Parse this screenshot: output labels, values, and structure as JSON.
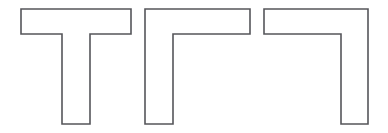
{
  "figure": {
    "background_color": "#ffffff",
    "stroke_color": "#55565a",
    "fill_color": "#ffffff",
    "stroke_width": 1.6,
    "canvas": {
      "width": 388,
      "height": 133
    },
    "shape_count": 3,
    "shapes": [
      {
        "name": "t-shape",
        "label": "T",
        "description": "T-shaped polygon: horizontal bar on top with a centered vertical stem descending",
        "orientation": "upright",
        "vertex_count": 8,
        "points": "21,9 131,9 131,34 90,34 90,124 62,124 62,34 21,34",
        "bbox": {
          "x": 21,
          "y": 9,
          "width": 110,
          "height": 115
        },
        "bar": {
          "x": 21,
          "y": 9,
          "width": 110,
          "height": 25
        },
        "stem": {
          "x": 62,
          "y": 34,
          "width": 28,
          "height": 90
        }
      },
      {
        "name": "gamma-shape",
        "label": "Γ",
        "description": "Gamma shaped polygon: horizontal bar on top with vertical leg descending from the left end",
        "orientation": "leg-left",
        "vertex_count": 6,
        "points": "145,9 250,9 250,34 173,34 173,124 145,124",
        "bbox": {
          "x": 145,
          "y": 9,
          "width": 105,
          "height": 115
        },
        "bar": {
          "x": 145,
          "y": 9,
          "width": 105,
          "height": 25
        },
        "leg": {
          "x": 145,
          "y": 34,
          "width": 28,
          "height": 90
        }
      },
      {
        "name": "mirrored-gamma-shape",
        "label": "7",
        "description": "Mirrored gamma / seven shaped polygon: horizontal bar on top with vertical leg descending from the right end",
        "orientation": "leg-right",
        "vertex_count": 6,
        "points": "264,9 368,9 368,124 341,124 341,34 264,34",
        "bbox": {
          "x": 264,
          "y": 9,
          "width": 104,
          "height": 115
        },
        "bar": {
          "x": 264,
          "y": 9,
          "width": 104,
          "height": 25
        },
        "leg": {
          "x": 341,
          "y": 34,
          "width": 27,
          "height": 90
        }
      }
    ]
  }
}
